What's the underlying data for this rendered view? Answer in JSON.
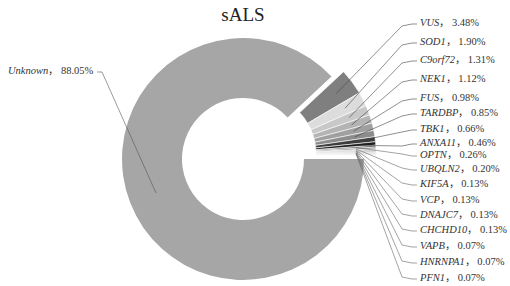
{
  "chart_data": {
    "type": "pie",
    "subtype": "donut",
    "title": "sALS",
    "separator": "，",
    "slices": [
      {
        "label": "Unknown",
        "value": 88.05,
        "color": "#a6a6a6",
        "label_x": 8,
        "label_y": 72,
        "side": "left"
      },
      {
        "label": "VUS",
        "value": 3.48,
        "color": "#7f7f7f",
        "label_y": 24
      },
      {
        "label": "SOD1",
        "value": 1.9,
        "color": "#dcdcdc",
        "label_y": 43
      },
      {
        "label": "C9orf72",
        "value": 1.31,
        "color": "#c8c8c8",
        "label_y": 61
      },
      {
        "label": "NEK1",
        "value": 1.12,
        "color": "#b4b4b4",
        "label_y": 80
      },
      {
        "label": "FUS",
        "value": 0.98,
        "color": "#a0a0a0",
        "label_y": 99
      },
      {
        "label": "TARDBP",
        "value": 0.85,
        "color": "#8c8c8c",
        "label_y": 114
      },
      {
        "label": "TBK1",
        "value": 0.66,
        "color": "#3c3c3c",
        "label_y": 130
      },
      {
        "label": "ANXA11",
        "value": 0.46,
        "color": "#1e1e1e",
        "label_y": 144
      },
      {
        "label": "OPTN",
        "value": 0.26,
        "color": "#6e6e6e",
        "label_y": 156
      },
      {
        "label": "UBQLN2",
        "value": 0.2,
        "color": "#505050",
        "label_y": 170
      },
      {
        "label": "KIF5A",
        "value": 0.13,
        "color": "#959595",
        "label_y": 185
      },
      {
        "label": "VCP",
        "value": 0.13,
        "color": "#777777",
        "label_y": 201
      },
      {
        "label": "DNAJC7",
        "value": 0.13,
        "color": "#5a5a5a",
        "label_y": 216
      },
      {
        "label": "CHCHD10",
        "value": 0.13,
        "color": "#888888",
        "label_y": 231
      },
      {
        "label": "VAPB",
        "value": 0.07,
        "color": "#666666",
        "label_y": 247
      },
      {
        "label": "HNRNPA1",
        "value": 0.07,
        "color": "#4a4a4a",
        "label_y": 263
      },
      {
        "label": "PFN1",
        "value": 0.07,
        "color": "#999999",
        "label_y": 279
      }
    ],
    "center": [
      243,
      159
    ],
    "outer_radius": 121,
    "inner_radius": 61,
    "explode_offset": 13,
    "legend_position": "none"
  }
}
